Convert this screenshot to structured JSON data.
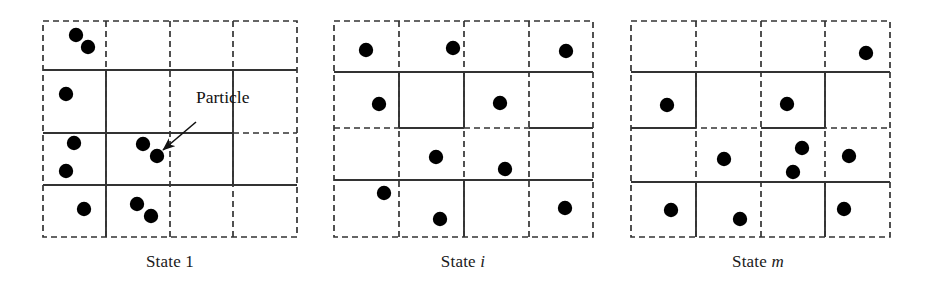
{
  "figure": {
    "title": "",
    "background": "#ffffff",
    "width": 930,
    "height": 281,
    "particle_color": "#000000",
    "grid_line_color": "#333333",
    "text_color": "#1a1a1a"
  },
  "annotation": {
    "label": "Particle",
    "label_x": 196,
    "label_y": 100,
    "arrow_from_x": 196,
    "arrow_from_y": 122,
    "arrow_to_x": 163,
    "arrow_to_y": 150
  },
  "panels": [
    {
      "id": "state-1",
      "caption": "State 1",
      "caption_suffix": "",
      "caption_italic": false,
      "caption_x": 170,
      "caption_y": 252,
      "grid": {
        "x": 43,
        "y": 21,
        "width": 254,
        "height": 216,
        "cols": 4,
        "rows": 4,
        "col_edges": [
          43,
          106,
          170,
          233,
          297
        ],
        "row_edges": [
          21,
          70,
          133,
          185,
          237
        ],
        "solid_segments": [
          {
            "type": "h",
            "y": 70,
            "x1": 43,
            "x2": 297
          },
          {
            "type": "h",
            "y": 133,
            "x1": 43,
            "x2": 233
          },
          {
            "type": "h",
            "y": 185,
            "x1": 43,
            "x2": 297
          },
          {
            "type": "v",
            "x": 106,
            "y1": 70,
            "y2": 237
          },
          {
            "type": "v",
            "x": 233,
            "y1": 133,
            "y2": 185
          },
          {
            "type": "v",
            "x": 233,
            "y1": 70,
            "y2": 133
          }
        ]
      },
      "particles": [
        {
          "x": 76,
          "y": 35
        },
        {
          "x": 88,
          "y": 47
        },
        {
          "x": 66,
          "y": 94
        },
        {
          "x": 74,
          "y": 143
        },
        {
          "x": 66,
          "y": 171
        },
        {
          "x": 143,
          "y": 144
        },
        {
          "x": 157,
          "y": 156
        },
        {
          "x": 84,
          "y": 209
        },
        {
          "x": 137,
          "y": 204
        },
        {
          "x": 151,
          "y": 216
        }
      ],
      "particle_count": 10
    },
    {
      "id": "state-i",
      "caption": "State ",
      "caption_suffix": "i",
      "caption_italic": true,
      "caption_x": 463,
      "caption_y": 252,
      "grid": {
        "x": 334,
        "y": 21,
        "width": 259,
        "height": 216,
        "cols": 4,
        "rows": 4,
        "col_edges": [
          334,
          399,
          464,
          529,
          593
        ],
        "row_edges": [
          21,
          72,
          128,
          180,
          237
        ],
        "solid_segments": [
          {
            "type": "h",
            "y": 72,
            "x1": 334,
            "x2": 593
          },
          {
            "type": "h",
            "y": 128,
            "x1": 399,
            "x2": 464
          },
          {
            "type": "h",
            "y": 128,
            "x1": 529,
            "x2": 593
          },
          {
            "type": "h",
            "y": 180,
            "x1": 334,
            "x2": 593
          },
          {
            "type": "v",
            "x": 464,
            "y1": 72,
            "y2": 128
          },
          {
            "type": "v",
            "x": 464,
            "y1": 180,
            "y2": 237
          },
          {
            "type": "v",
            "x": 399,
            "y1": 72,
            "y2": 128
          }
        ]
      },
      "particles": [
        {
          "x": 366,
          "y": 50
        },
        {
          "x": 453,
          "y": 48
        },
        {
          "x": 566,
          "y": 51
        },
        {
          "x": 379,
          "y": 104
        },
        {
          "x": 500,
          "y": 103
        },
        {
          "x": 436,
          "y": 157
        },
        {
          "x": 505,
          "y": 169
        },
        {
          "x": 384,
          "y": 193
        },
        {
          "x": 440,
          "y": 219
        },
        {
          "x": 565,
          "y": 208
        }
      ],
      "particle_count": 10
    },
    {
      "id": "state-m",
      "caption": "State ",
      "caption_suffix": "m",
      "caption_italic": true,
      "caption_x": 758,
      "caption_y": 252,
      "grid": {
        "x": 631,
        "y": 21,
        "width": 259,
        "height": 216,
        "cols": 4,
        "rows": 4,
        "col_edges": [
          631,
          696,
          761,
          825,
          890
        ],
        "row_edges": [
          21,
          72,
          128,
          182,
          237
        ],
        "solid_segments": [
          {
            "type": "h",
            "y": 72,
            "x1": 631,
            "x2": 890
          },
          {
            "type": "h",
            "y": 128,
            "x1": 631,
            "x2": 696
          },
          {
            "type": "h",
            "y": 128,
            "x1": 761,
            "x2": 825
          },
          {
            "type": "h",
            "y": 182,
            "x1": 631,
            "x2": 890
          },
          {
            "type": "v",
            "x": 696,
            "y1": 72,
            "y2": 128
          },
          {
            "type": "v",
            "x": 825,
            "y1": 72,
            "y2": 128
          },
          {
            "type": "v",
            "x": 696,
            "y1": 182,
            "y2": 237
          },
          {
            "type": "v",
            "x": 825,
            "y1": 182,
            "y2": 237
          }
        ]
      },
      "particles": [
        {
          "x": 866,
          "y": 53
        },
        {
          "x": 667,
          "y": 105
        },
        {
          "x": 787,
          "y": 104
        },
        {
          "x": 724,
          "y": 159
        },
        {
          "x": 802,
          "y": 148
        },
        {
          "x": 793,
          "y": 172
        },
        {
          "x": 849,
          "y": 156
        },
        {
          "x": 671,
          "y": 210
        },
        {
          "x": 740,
          "y": 219
        },
        {
          "x": 844,
          "y": 209
        }
      ],
      "particle_count": 10
    }
  ]
}
